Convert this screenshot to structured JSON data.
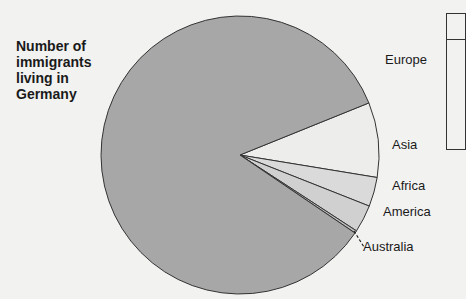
{
  "chart_data": {
    "type": "pie",
    "title": "Number of immigrants living in Germany",
    "title_lines": [
      "Number of",
      "immigrants",
      "living in",
      "Germany"
    ],
    "categories": [
      "Europe",
      "Asia",
      "Africa",
      "America",
      "Australia"
    ],
    "values": [
      84.4,
      8.7,
      3.4,
      3.2,
      0.3
    ],
    "unit": "% (estimated from slice angles)",
    "colors": [
      "#a7a7a7",
      "#ededec",
      "#dadada",
      "#d0d0d0",
      "#bcbcbc"
    ],
    "legend_position": "labels beside slices",
    "grid": false
  },
  "labels": {
    "europe": "Europe",
    "asia": "Asia",
    "africa": "Africa",
    "america": "America",
    "australia": "Australia"
  },
  "colors": {
    "background": "#f2f2f1",
    "outline": "#333333"
  }
}
